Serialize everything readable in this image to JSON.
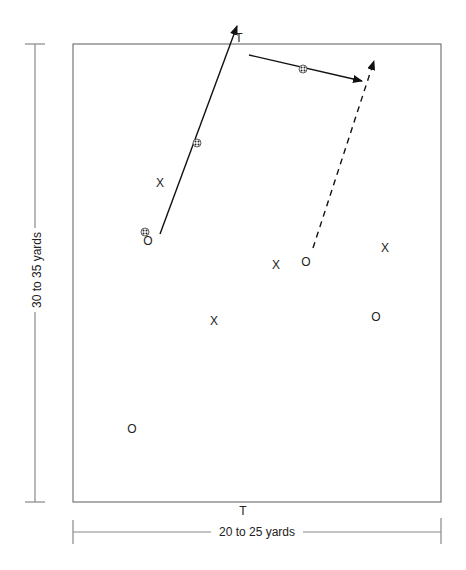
{
  "diagram": {
    "field": {
      "left": 73,
      "top": 44,
      "right": 441,
      "bottom": 502,
      "stroke": "#777777"
    },
    "goals": [
      {
        "label": "T",
        "position": "top",
        "x": 239,
        "y": 38
      },
      {
        "label": "T",
        "position": "bottom",
        "x": 243,
        "y": 511
      }
    ],
    "dimensions": {
      "length_label": "30 to 35 yards",
      "width_label": "20 to 25 yards"
    },
    "players": [
      {
        "symbol": "X",
        "team": "defense",
        "x": 160,
        "y": 183
      },
      {
        "symbol": "O",
        "team": "offense",
        "x": 148,
        "y": 241,
        "has_ball": true
      },
      {
        "symbol": "X",
        "team": "defense",
        "x": 276,
        "y": 265
      },
      {
        "symbol": "O",
        "team": "offense",
        "x": 306,
        "y": 262
      },
      {
        "symbol": "X",
        "team": "defense",
        "x": 385,
        "y": 248
      },
      {
        "symbol": "X",
        "team": "defense",
        "x": 214,
        "y": 321
      },
      {
        "symbol": "O",
        "team": "offense",
        "x": 376,
        "y": 317
      },
      {
        "symbol": "O",
        "team": "offense",
        "x": 132,
        "y": 429
      }
    ],
    "arrows": [
      {
        "type": "pass",
        "style": "solid",
        "from": [
          160,
          234
        ],
        "to": [
          237,
          26
        ]
      },
      {
        "type": "pass",
        "style": "solid",
        "from": [
          249,
          55
        ],
        "to": [
          362,
          81
        ]
      },
      {
        "type": "run",
        "style": "dashed",
        "from": [
          313,
          248
        ],
        "to": [
          374,
          61
        ]
      }
    ],
    "balls": [
      {
        "x": 145,
        "y": 232
      },
      {
        "x": 197,
        "y": 143
      },
      {
        "x": 303,
        "y": 69
      }
    ]
  }
}
